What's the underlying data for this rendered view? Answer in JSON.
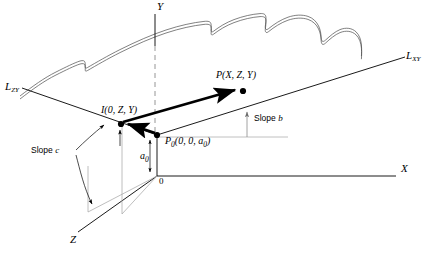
{
  "figure": {
    "background_color": "#ffffff",
    "line_color": "#000000",
    "gray_line_color": "#9a9a9a",
    "thick_vector_color": "#000000"
  },
  "axes": {
    "x_label": "X",
    "y_label": "Y",
    "z_label": "Z",
    "origin_label": "0"
  },
  "boundary_lines": {
    "left_label_base": "L",
    "left_label_sub": "ZY",
    "right_label_base": "L",
    "right_label_sub": "XY"
  },
  "points": [
    {
      "id": "point-P",
      "label": "P(X, Z, Y)",
      "x": 243,
      "y": 90
    },
    {
      "id": "point-I",
      "label": "I(0, Z, Y)",
      "x": 122,
      "y": 124
    },
    {
      "id": "point-P0",
      "label": "P",
      "label_sub": "0",
      "label_rest": "(0, 0, a",
      "label_rest_sub": "0",
      "label_tail": ")",
      "x": 157,
      "y": 135
    }
  ],
  "annotations": {
    "slope_b": "Slope b",
    "slope_b_word": "Slope",
    "slope_b_var": "b",
    "slope_c": "Slope c",
    "slope_c_word": "Slope",
    "slope_c_var": "c",
    "a0_base": "a",
    "a0_sub": "0"
  }
}
